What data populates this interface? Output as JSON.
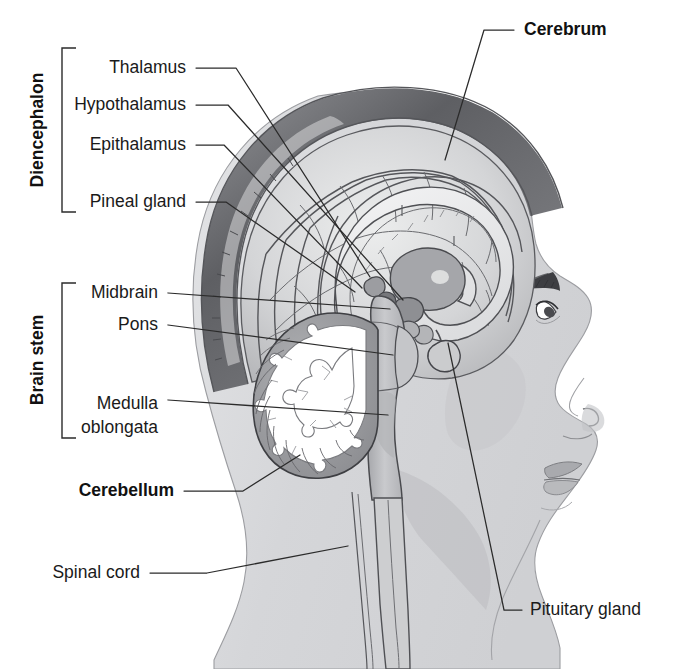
{
  "figure": {
    "background_color": "#ffffff",
    "line_color": "#2b2b2b"
  },
  "groups": [
    {
      "id": "diencephalon",
      "label": "Diencephalon",
      "orientation": "vertical",
      "bracket": {
        "x": 62,
        "y_top": 48,
        "y_bottom": 212
      }
    },
    {
      "id": "brain-stem",
      "label": "Brain stem",
      "orientation": "vertical",
      "bracket": {
        "x": 62,
        "y_top": 283,
        "y_bottom": 438
      }
    }
  ],
  "labels": [
    {
      "id": "thalamus",
      "text": "Thalamus",
      "bold": false,
      "anchor": "end",
      "x": 186,
      "y": 68,
      "leader": "M196,68 L236,68 L370,277",
      "target": {
        "x": 370,
        "y": 277
      }
    },
    {
      "id": "hypothalamus",
      "text": "Hypothalamus",
      "bold": false,
      "anchor": "end",
      "x": 186,
      "y": 105,
      "leader": "M196,105 L228,105 L403,300",
      "target": {
        "x": 403,
        "y": 300
      }
    },
    {
      "id": "epithalamus",
      "text": "Epithalamus",
      "bold": false,
      "anchor": "end",
      "x": 186,
      "y": 145,
      "leader": "M196,145 L224,145 L362,288",
      "target": {
        "x": 362,
        "y": 288
      }
    },
    {
      "id": "pineal-gland",
      "text": "Pineal gland",
      "bold": false,
      "anchor": "end",
      "x": 186,
      "y": 202,
      "leader": "M196,202 L226,202 L355,292",
      "target": {
        "x": 355,
        "y": 292
      }
    },
    {
      "id": "cerebrum",
      "text": "Cerebrum",
      "bold": true,
      "anchor": "start",
      "x": 524,
      "y": 30,
      "leader": "M514,30 L484,30 L445,160",
      "target": {
        "x": 445,
        "y": 160
      }
    },
    {
      "id": "midbrain",
      "text": "Midbrain",
      "bold": false,
      "anchor": "end",
      "x": 158,
      "y": 293,
      "leader": "M168,293 L390,309",
      "target": {
        "x": 390,
        "y": 309
      }
    },
    {
      "id": "pons",
      "text": "Pons",
      "bold": false,
      "anchor": "end",
      "x": 158,
      "y": 325,
      "leader": "M168,325 L393,355",
      "target": {
        "x": 393,
        "y": 355
      }
    },
    {
      "id": "medulla-oblongata",
      "text": "Medulla",
      "text_line2": "oblongata",
      "bold": false,
      "anchor": "end",
      "x": 158,
      "y": 404,
      "leader": "M168,400 L388,415",
      "target": {
        "x": 388,
        "y": 415
      }
    },
    {
      "id": "cerebellum",
      "text": "Cerebellum",
      "bold": true,
      "anchor": "end",
      "x": 174,
      "y": 491,
      "leader": "M184,491 L243,491 L300,455",
      "target": {
        "x": 300,
        "y": 455
      }
    },
    {
      "id": "spinal-cord",
      "text": "Spinal cord",
      "bold": false,
      "anchor": "end",
      "x": 140,
      "y": 573,
      "leader": "M150,573 L207,573 L348,546",
      "target": {
        "x": 348,
        "y": 546
      }
    },
    {
      "id": "pituitary-gland",
      "text": "Pituitary gland",
      "bold": false,
      "anchor": "start",
      "x": 530,
      "y": 610,
      "leader": "M522,610 L504,610 L448,343",
      "target": {
        "x": 448,
        "y": 343
      }
    }
  ],
  "anatomy": {
    "regions": [
      {
        "id": "head-skin",
        "name": "head-and-face-profile",
        "color": "#d7d8da"
      },
      {
        "id": "skull-rim",
        "name": "scalp-and-skull-rim",
        "color": "#6f7074"
      },
      {
        "id": "cerebrum",
        "name": "cerebral-cortex",
        "color": "#cfd0d2"
      },
      {
        "id": "corpus-callosum",
        "name": "corpus-callosum",
        "color": "#e8e9ea"
      },
      {
        "id": "thalamus",
        "name": "thalamus-body",
        "color": "#a9aaad"
      },
      {
        "id": "brainstem",
        "name": "brainstem",
        "color": "#b8b9bc"
      },
      {
        "id": "cerebellum",
        "name": "cerebellum",
        "color": "#9b9c9f"
      },
      {
        "id": "arbor-vitae",
        "name": "arbor-vitae-white-matter",
        "color": "#ffffff"
      },
      {
        "id": "pituitary",
        "name": "pituitary-gland",
        "color": "#d0d1d3"
      },
      {
        "id": "spinal-cord",
        "name": "spinal-cord",
        "color": "#cacbcd"
      }
    ]
  }
}
